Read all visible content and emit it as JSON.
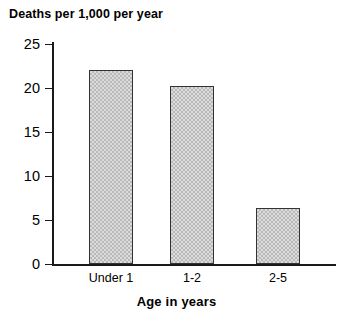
{
  "chart_data": {
    "type": "bar",
    "title": "Deaths per 1,000 per year",
    "xlabel": "Age in years",
    "ylabel": "",
    "categories": [
      "Under 1",
      "1-2",
      "2-5"
    ],
    "values": [
      22.0,
      20.2,
      6.4
    ],
    "ylim": [
      0,
      25
    ],
    "yticks": [
      0,
      5,
      10,
      15,
      20,
      25
    ],
    "ytick_labels": [
      "0",
      "5",
      "10",
      "15",
      "20",
      "25"
    ],
    "grid": false,
    "legend": null,
    "bar_fill_color": "#dcdcdc",
    "bar_pattern_color": "#b9b9b9",
    "bar_border_color": "#333333",
    "axis_color": "#1a1a1a",
    "background_color": "#ffffff"
  }
}
